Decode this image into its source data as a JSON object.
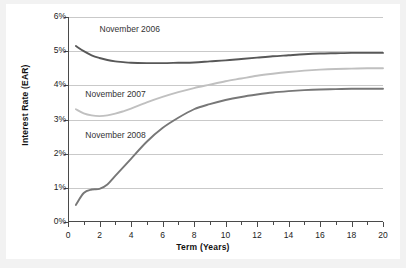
{
  "chart_data": {
    "type": "line",
    "title": "",
    "xlabel": "Term (Years)",
    "ylabel": "Interest Rate (EAR)",
    "xlim": [
      0,
      20
    ],
    "ylim": [
      0,
      6
    ],
    "grid": true,
    "legend_position": "inline-annotations",
    "x_ticks": [
      0,
      2,
      4,
      6,
      8,
      10,
      12,
      14,
      16,
      18,
      20
    ],
    "x_tick_labels": [
      "0",
      "2",
      "4",
      "6",
      "8",
      "10",
      "12",
      "14",
      "16",
      "18",
      "20"
    ],
    "x_minor_ticks": [
      1,
      3,
      5,
      7,
      9,
      11,
      13,
      15,
      17,
      19
    ],
    "y_ticks": [
      0,
      1,
      2,
      3,
      4,
      5,
      6
    ],
    "y_tick_labels": [
      "0%",
      "1%",
      "2%",
      "3%",
      "4%",
      "5%",
      "6%"
    ],
    "series": [
      {
        "name": "November 2006",
        "color": "#585858",
        "label_x": 2.0,
        "label_y": 5.62,
        "x": [
          0.5,
          1,
          1.5,
          2,
          2.5,
          3,
          3.5,
          4,
          5,
          6,
          7,
          8,
          9,
          10,
          11,
          12,
          13,
          14,
          15,
          16,
          17,
          18,
          19,
          20
        ],
        "values": [
          5.15,
          5.0,
          4.88,
          4.8,
          4.74,
          4.7,
          4.68,
          4.66,
          4.65,
          4.65,
          4.66,
          4.67,
          4.7,
          4.73,
          4.77,
          4.81,
          4.85,
          4.88,
          4.91,
          4.93,
          4.94,
          4.95,
          4.95,
          4.95
        ]
      },
      {
        "name": "November 2007",
        "color": "#c0c0c0",
        "label_x": 1.1,
        "label_y": 3.72,
        "x": [
          0.5,
          1,
          1.5,
          2,
          2.5,
          3,
          3.5,
          4,
          5,
          6,
          7,
          8,
          9,
          10,
          11,
          12,
          13,
          14,
          15,
          16,
          17,
          18,
          19,
          20
        ],
        "values": [
          3.3,
          3.18,
          3.12,
          3.1,
          3.12,
          3.17,
          3.24,
          3.32,
          3.5,
          3.66,
          3.8,
          3.92,
          4.02,
          4.12,
          4.2,
          4.28,
          4.34,
          4.39,
          4.43,
          4.46,
          4.48,
          4.49,
          4.5,
          4.5
        ]
      },
      {
        "name": "November 2008",
        "color": "#777777",
        "label_x": 1.1,
        "label_y": 2.52,
        "x": [
          0.5,
          1,
          1.5,
          2,
          2.5,
          3,
          3.5,
          4,
          5,
          6,
          7,
          8,
          9,
          10,
          11,
          12,
          13,
          14,
          15,
          16,
          17,
          18,
          19,
          20
        ],
        "values": [
          0.5,
          0.85,
          0.95,
          0.97,
          1.1,
          1.35,
          1.6,
          1.85,
          2.35,
          2.75,
          3.05,
          3.3,
          3.45,
          3.57,
          3.66,
          3.73,
          3.79,
          3.83,
          3.86,
          3.88,
          3.89,
          3.9,
          3.9,
          3.9
        ]
      }
    ]
  },
  "axes": {
    "ylabel": "Interest Rate (EAR)",
    "xlabel": "Term (Years)"
  }
}
